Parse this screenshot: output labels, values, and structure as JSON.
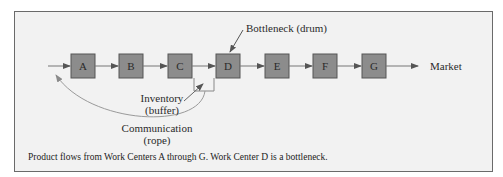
{
  "diagram": {
    "work_centers": [
      {
        "id": "A",
        "label": "A"
      },
      {
        "id": "B",
        "label": "B"
      },
      {
        "id": "C",
        "label": "C"
      },
      {
        "id": "D",
        "label": "D"
      },
      {
        "id": "E",
        "label": "E"
      },
      {
        "id": "F",
        "label": "F"
      },
      {
        "id": "G",
        "label": "G"
      }
    ],
    "labels": {
      "bottleneck": "Bottleneck (drum)",
      "inventory_line1": "Inventory",
      "inventory_line2": "(buffer)",
      "communication_line1": "Communication",
      "communication_line2": "(rope)",
      "market": "Market"
    },
    "caption": "Product flows from Work Centers A through G. Work Center D is a bottleneck.",
    "colors": {
      "box_fill": "#8c8c8c",
      "box_border": "#555555",
      "arrow": "#666666",
      "rope": "#9a9a9a",
      "background": "#f2f2f2"
    }
  }
}
